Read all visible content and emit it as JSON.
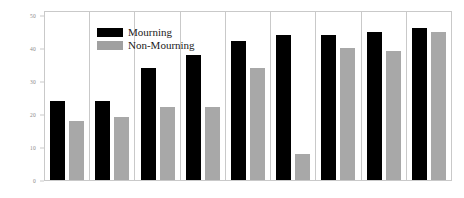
{
  "chart_data": {
    "type": "bar",
    "title": "",
    "subtitle": "",
    "xlabel": "",
    "ylabel": "",
    "ylim": [
      0,
      50
    ],
    "yticks": [
      0,
      10,
      20,
      30,
      40,
      50
    ],
    "ytick_labels": [
      "0",
      "10",
      "20",
      "30",
      "40",
      "50"
    ],
    "grid": false,
    "legend_position": "top-left",
    "categories": [
      "1",
      "2",
      "3",
      "4",
      "5",
      "6",
      "7",
      "8",
      "9"
    ],
    "series": [
      {
        "name": "Mourning",
        "color": "#000000",
        "values": [
          24,
          24,
          34,
          38,
          42,
          44,
          44,
          45,
          46
        ]
      },
      {
        "name": "Non-Mourning",
        "color": "#a8a8a8",
        "values": [
          18,
          19,
          22,
          22,
          34,
          8,
          40,
          39,
          45
        ]
      }
    ]
  },
  "legend": {
    "items": [
      {
        "label": "Mourning",
        "swatch": "mourning"
      },
      {
        "label": "Non-Mourning",
        "swatch": "nonmourning"
      }
    ]
  },
  "colors": {
    "mourning": "#000000",
    "non_mourning": "#a8a8a8",
    "axis": "#c9c9c9",
    "tick_text": "#8a8a8a",
    "background": "#ffffff"
  }
}
